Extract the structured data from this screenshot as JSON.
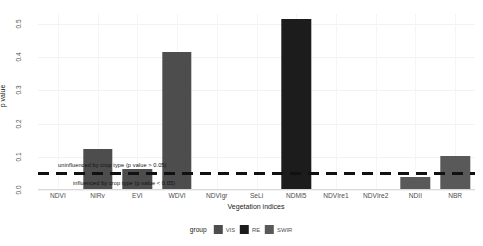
{
  "chart_data": {
    "type": "bar",
    "title": "",
    "xlabel": "Vegetation indices",
    "ylabel": "p value",
    "ylim": [
      0.0,
      0.53
    ],
    "yticks": [
      "0.0",
      "0.1",
      "0.2",
      "0.3",
      "0.4",
      "0.5"
    ],
    "ytick_values": [
      0.0,
      0.1,
      0.2,
      0.3,
      0.4,
      0.5
    ],
    "grid": true,
    "legend_position": "bottom",
    "legend_title": "group",
    "categories": [
      "NDVI",
      "NIRv",
      "EVI",
      "WDVI",
      "NDVIgr",
      "SeLi",
      "NDMI5",
      "NDVIre1",
      "NDVIre2",
      "NDII",
      "NBR"
    ],
    "values": [
      0.001,
      0.124,
      0.062,
      0.415,
      0.001,
      0.002,
      0.515,
      0.001,
      0.001,
      0.038,
      0.101
    ],
    "groups": [
      "VIS",
      "VIS",
      "VIS",
      "VIS",
      "VIS",
      "RE",
      "RE",
      "RE",
      "RE",
      "SWIR",
      "SWIR"
    ],
    "series": [
      {
        "name": "p value",
        "points": [
          {
            "category": "NDVI",
            "value": 0.001,
            "group": "VIS"
          },
          {
            "category": "NIRv",
            "value": 0.124,
            "group": "VIS"
          },
          {
            "category": "EVI",
            "value": 0.062,
            "group": "VIS"
          },
          {
            "category": "WDVI",
            "value": 0.415,
            "group": "VIS"
          },
          {
            "category": "NDVIgr",
            "value": 0.001,
            "group": "VIS"
          },
          {
            "category": "SeLi",
            "value": 0.002,
            "group": "RE"
          },
          {
            "category": "NDMI5",
            "value": 0.515,
            "group": "RE"
          },
          {
            "category": "NDVIre1",
            "value": 0.001,
            "group": "RE"
          },
          {
            "category": "NDVIre2",
            "value": 0.001,
            "group": "RE"
          },
          {
            "category": "NDII",
            "value": 0.038,
            "group": "SWIR"
          },
          {
            "category": "NBR",
            "value": 0.101,
            "group": "SWIR"
          }
        ]
      }
    ],
    "legend": [
      {
        "label": "VIS",
        "color": "#4d4d4d"
      },
      {
        "label": "RE",
        "color": "#1c1c1c"
      },
      {
        "label": "SWIR",
        "color": "#595959"
      }
    ],
    "threshold_line": {
      "value": 0.05,
      "style": "dashed",
      "color": "#111111",
      "label_above": "uninfluenced by crop type (p value > 0.05)",
      "label_below": "influenced by crop type (p value < 0.05)"
    }
  },
  "colors": {
    "vis": "#4d4d4d",
    "re": "#1c1c1c",
    "swir": "#595959",
    "grid": "#f2f2f2",
    "axis_text": "#4d4d4d",
    "threshold": "#111111"
  }
}
